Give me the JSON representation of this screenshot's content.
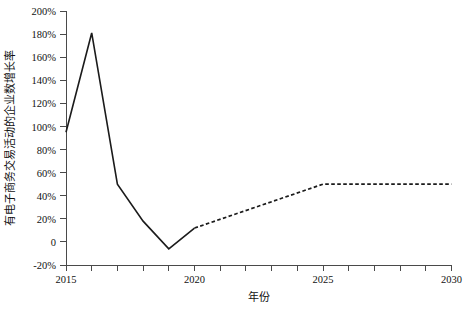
{
  "chart_data": {
    "type": "line",
    "title": "",
    "xlabel": "年份",
    "ylabel": "有电子商务交易活动的企业数增长率",
    "xlim": [
      2015,
      2030
    ],
    "ylim": [
      -20,
      200
    ],
    "grid": false,
    "legend": "none",
    "x_tick_labels": [
      "2015",
      "2020",
      "2025",
      "2030"
    ],
    "x_tick_values": [
      2015,
      2020,
      2025,
      2030
    ],
    "x_minor_ticks": [
      2016,
      2017,
      2018,
      2019,
      2021,
      2022,
      2023,
      2024,
      2026,
      2027,
      2028,
      2029
    ],
    "y_tick_labels": [
      "200%",
      "180%",
      "160%",
      "140%",
      "120%",
      "100%",
      "80%",
      "60%",
      "40%",
      "20%",
      "0",
      "-20%"
    ],
    "y_tick_values": [
      200,
      180,
      160,
      140,
      120,
      100,
      80,
      60,
      40,
      20,
      0,
      -20
    ],
    "series": [
      {
        "name": "历史值",
        "style": "solid",
        "color": "#1b1b1b",
        "x": [
          2015,
          2016,
          2017,
          2018,
          2019,
          2020
        ],
        "values": [
          95,
          181,
          50,
          18,
          -6,
          12
        ]
      },
      {
        "name": "预测值",
        "style": "dashed",
        "color": "#1b1b1b",
        "x": [
          2020,
          2025,
          2030
        ],
        "values": [
          12,
          50,
          50
        ]
      }
    ]
  },
  "caption": ""
}
